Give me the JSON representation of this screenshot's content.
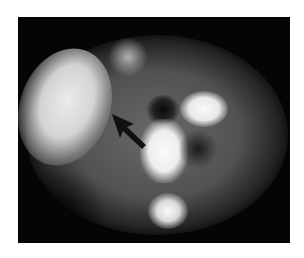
{
  "image": {
    "kind": "grayscale nuclear medicine scan",
    "annotation": "arrow",
    "arrow_color": "#111111",
    "background_color": "#ffffff",
    "scan_background": "#050505"
  }
}
